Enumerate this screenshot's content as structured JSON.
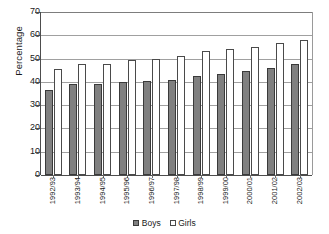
{
  "chart_data": {
    "type": "bar",
    "title": "",
    "subtitle": "",
    "xlabel": "",
    "ylabel": "Percentage",
    "ylim": [
      0,
      70
    ],
    "ytick_step": 10,
    "yticks": [
      70,
      60,
      50,
      40,
      30,
      20,
      10,
      0
    ],
    "grid": true,
    "grid_axis": "y",
    "legend_position": "bottom",
    "orientation": "vertical",
    "grouping": "grouped",
    "categories": [
      "1992/93",
      "1993/94",
      "1994/95",
      "1995/96",
      "1996/97",
      "1997/98",
      "1998/99",
      "1999/00",
      "2000/01",
      "2001/02",
      "2002/03"
    ],
    "series": [
      {
        "name": "Boys",
        "color": "#808080",
        "border_color": "#3a3a3a",
        "values": [
          36.5,
          39.2,
          39.0,
          40.0,
          40.3,
          41.0,
          42.6,
          43.5,
          44.5,
          46.0,
          47.5
        ]
      },
      {
        "name": "Girls",
        "color": "#ffffff",
        "border_color": "#4a4a4a",
        "values": [
          45.4,
          47.5,
          47.8,
          49.3,
          50.0,
          51.2,
          53.2,
          54.0,
          54.8,
          56.6,
          58.0
        ]
      }
    ]
  },
  "legend": {
    "items": [
      {
        "label": "Boys",
        "marker": "filled-gray-square"
      },
      {
        "label": "Girls",
        "marker": "outlined-white-square"
      }
    ]
  },
  "axes": {
    "y_title": "Percentage"
  }
}
